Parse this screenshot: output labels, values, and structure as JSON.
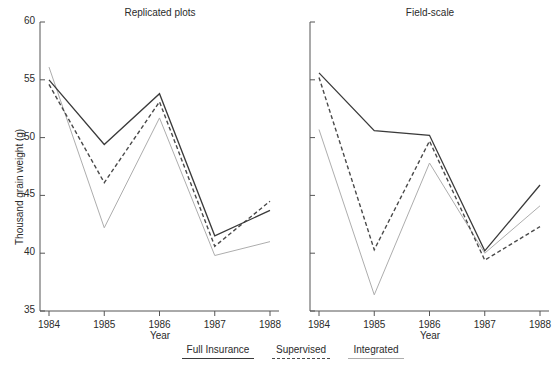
{
  "figure": {
    "ylabel": "Thousand grain weight (g)",
    "xlabel_left": "Year",
    "xlabel_right": "Year"
  },
  "legend": {
    "items": [
      {
        "label": "Full Insurance",
        "style": "solid",
        "color": "#3a3a3a"
      },
      {
        "label": "Supervised",
        "style": "dashed",
        "color": "#4a4a4a"
      },
      {
        "label": "Integrated",
        "style": "solid",
        "color": "#adadad"
      }
    ]
  },
  "axes": {
    "y_ticks": [
      "60",
      "55",
      "50",
      "45",
      "40",
      "35"
    ],
    "x_ticks": [
      "1984",
      "1985",
      "1986",
      "1987",
      "1988"
    ]
  },
  "chart_data": [
    {
      "type": "line",
      "title": "Replicated plots",
      "xlabel": "Year",
      "ylabel": "Thousand grain weight (g)",
      "x": [
        1984,
        1985,
        1986,
        1987,
        1988
      ],
      "categories": [
        "1984",
        "1985",
        "1986",
        "1987",
        "1988"
      ],
      "ylim": [
        35,
        60
      ],
      "xlim": [
        1984,
        1988
      ],
      "grid": false,
      "legend_position": "bottom",
      "series": [
        {
          "name": "Full Insurance",
          "style": "solid",
          "color": "#3a3a3a",
          "values": [
            55.0,
            49.4,
            53.8,
            41.5,
            43.7
          ]
        },
        {
          "name": "Supervised",
          "style": "dashed",
          "color": "#4a4a4a",
          "values": [
            54.6,
            46.1,
            53.1,
            40.6,
            44.5
          ]
        },
        {
          "name": "Integrated",
          "style": "solid",
          "color": "#adadad",
          "values": [
            56.1,
            42.2,
            51.7,
            39.8,
            41.0
          ]
        }
      ]
    },
    {
      "type": "line",
      "title": "Field-scale",
      "xlabel": "Year",
      "ylabel": "Thousand grain weight (g)",
      "x": [
        1984,
        1985,
        1986,
        1987,
        1988
      ],
      "categories": [
        "1984",
        "1985",
        "1986",
        "1987",
        "1988"
      ],
      "ylim": [
        35,
        60
      ],
      "xlim": [
        1984,
        1988
      ],
      "grid": false,
      "legend_position": "bottom",
      "series": [
        {
          "name": "Full Insurance",
          "style": "solid",
          "color": "#3a3a3a",
          "values": [
            55.6,
            50.6,
            50.2,
            40.2,
            45.9
          ]
        },
        {
          "name": "Supervised",
          "style": "dashed",
          "color": "#4a4a4a",
          "values": [
            55.2,
            40.3,
            49.7,
            39.4,
            42.3
          ]
        },
        {
          "name": "Integrated",
          "style": "solid",
          "color": "#adadad",
          "values": [
            50.7,
            36.4,
            47.8,
            40.0,
            44.1
          ]
        }
      ]
    }
  ]
}
